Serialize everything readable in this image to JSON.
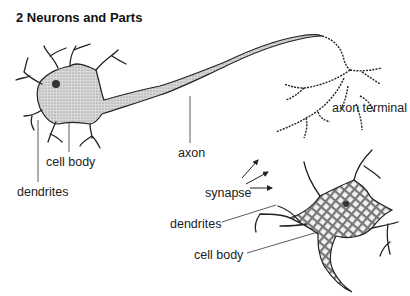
{
  "title": "2 Neurons and Parts",
  "labels": {
    "cell_body_1": "cell body",
    "dendrites_1": "dendrites",
    "axon": "axon",
    "axon_terminal": "axon terminal",
    "synapse": "synapse",
    "dendrites_2": "dendrites",
    "cell_body_2": "cell body"
  },
  "colors": {
    "ink": "#222222",
    "fill": "#bdbdbd",
    "background": "#ffffff"
  }
}
